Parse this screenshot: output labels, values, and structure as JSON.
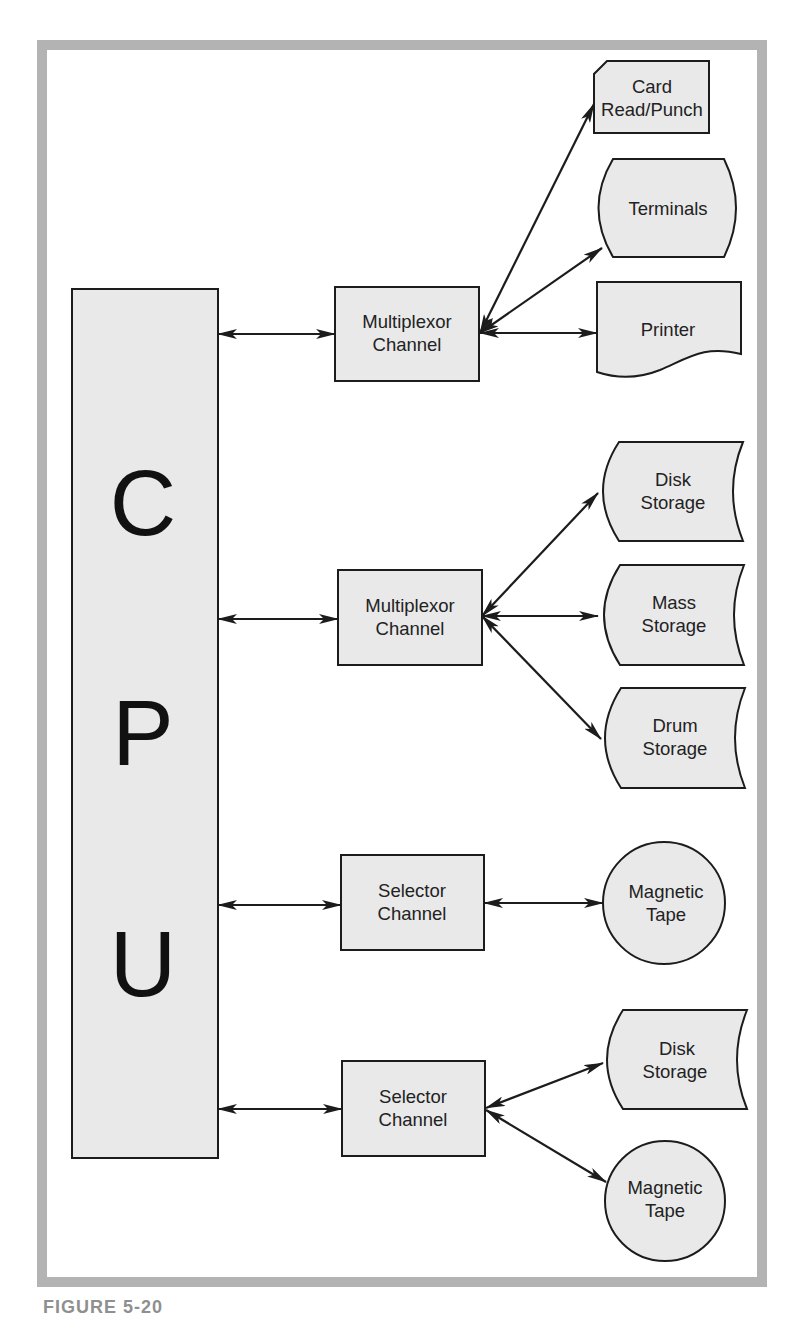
{
  "figure": {
    "caption": "FIGURE 5-20",
    "frame_color": "#b3b3b3",
    "fill_color": "#e9e9e9",
    "line_color": "#1c1c1c"
  },
  "cpu": {
    "label": "CPU",
    "letters": [
      "C",
      "P",
      "U"
    ]
  },
  "channels": [
    {
      "type": "multiplexor",
      "lines": [
        "Multiplexor",
        "Channel"
      ]
    },
    {
      "type": "multiplexor",
      "lines": [
        "Multiplexor",
        "Channel"
      ]
    },
    {
      "type": "selector",
      "lines": [
        "Selector",
        "Channel"
      ]
    },
    {
      "type": "selector",
      "lines": [
        "Selector",
        "Channel"
      ]
    }
  ],
  "devices": [
    {
      "channel": 0,
      "shape": "punched-card",
      "lines": [
        "Card",
        "Read/Punch"
      ]
    },
    {
      "channel": 0,
      "shape": "display",
      "lines": [
        "Terminals"
      ]
    },
    {
      "channel": 0,
      "shape": "document",
      "lines": [
        "Printer"
      ]
    },
    {
      "channel": 1,
      "shape": "stored-data",
      "lines": [
        "Disk",
        "Storage"
      ]
    },
    {
      "channel": 1,
      "shape": "stored-data",
      "lines": [
        "Mass",
        "Storage"
      ]
    },
    {
      "channel": 1,
      "shape": "stored-data",
      "lines": [
        "Drum",
        "Storage"
      ]
    },
    {
      "channel": 2,
      "shape": "circle",
      "lines": [
        "Magnetic",
        "Tape"
      ]
    },
    {
      "channel": 3,
      "shape": "stored-data",
      "lines": [
        "Disk",
        "Storage"
      ]
    },
    {
      "channel": 3,
      "shape": "circle",
      "lines": [
        "Magnetic",
        "Tape"
      ]
    }
  ]
}
